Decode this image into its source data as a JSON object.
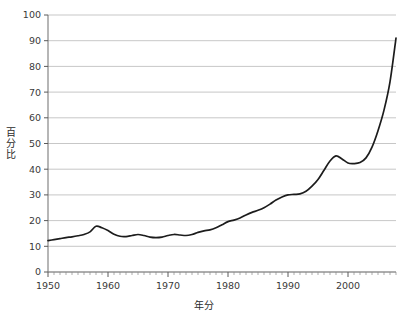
{
  "chart_data": {
    "type": "line",
    "title": "",
    "subtitle": "",
    "xlabel": "年分",
    "ylabel": "百分比",
    "xlim": [
      1950,
      2008
    ],
    "ylim": [
      0,
      100
    ],
    "grid": true,
    "legend": false,
    "legend_position": "none",
    "line_color": "#1c1c1c",
    "grid_color": "#b9b9b9",
    "axis_color": "#7a7a7a",
    "background_color": "#ffffff",
    "y_ticks": [
      0,
      10,
      20,
      30,
      40,
      50,
      60,
      70,
      80,
      90,
      100
    ],
    "y_tick_labels": [
      "0",
      "10",
      "20",
      "30",
      "40",
      "50",
      "60",
      "70",
      "80",
      "90",
      "100"
    ],
    "x_ticks": [
      1950,
      1960,
      1970,
      1980,
      1990,
      2000
    ],
    "x_tick_labels": [
      "1950",
      "1960",
      "1970",
      "1980",
      "1990",
      "2000"
    ],
    "x_minor_tick_step": 1,
    "x": [
      1950,
      1951,
      1952,
      1953,
      1954,
      1955,
      1956,
      1957,
      1958,
      1959,
      1960,
      1961,
      1962,
      1963,
      1964,
      1965,
      1966,
      1967,
      1968,
      1969,
      1970,
      1971,
      1972,
      1973,
      1974,
      1975,
      1976,
      1977,
      1978,
      1979,
      1980,
      1981,
      1982,
      1983,
      1984,
      1985,
      1986,
      1987,
      1988,
      1989,
      1990,
      1991,
      1992,
      1993,
      1994,
      1995,
      1996,
      1997,
      1998,
      1999,
      2000,
      2001,
      2002,
      2003,
      2004,
      2005,
      2006,
      2007,
      2008
    ],
    "values": [
      12.2,
      12.6,
      13.0,
      13.4,
      13.7,
      14.1,
      14.6,
      15.6,
      17.8,
      17.2,
      16.1,
      14.7,
      13.9,
      13.8,
      14.2,
      14.6,
      14.2,
      13.6,
      13.4,
      13.6,
      14.2,
      14.6,
      14.4,
      14.2,
      14.6,
      15.4,
      16.0,
      16.4,
      17.2,
      18.4,
      19.6,
      20.2,
      21.0,
      22.2,
      23.2,
      24.0,
      25.0,
      26.4,
      28.0,
      29.2,
      30.0,
      30.2,
      30.4,
      31.4,
      33.4,
      36.0,
      39.6,
      43.2,
      45.2,
      44.0,
      42.4,
      42.2,
      42.6,
      44.4,
      48.6,
      55.0,
      63.0,
      74.0,
      91.0
    ],
    "series_name": "百分比"
  },
  "axis": {
    "y_title": "百分比",
    "x_title": "年分"
  }
}
